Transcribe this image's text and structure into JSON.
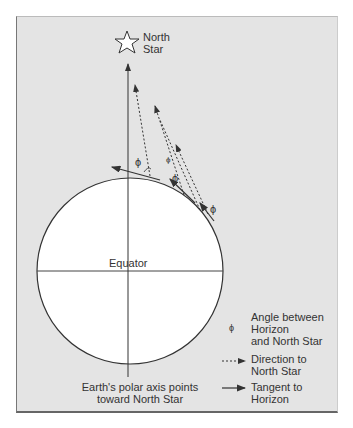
{
  "star_label": "North\nStar",
  "star_label_l1": "North",
  "star_label_l2": "Star",
  "equator_label": "Equator",
  "axis_caption_l1": "Earth's polar axis points",
  "axis_caption_l2": "toward North Star",
  "angle_symbol": "ϕ",
  "legend": {
    "items": [
      {
        "symbol": "ϕ",
        "label_l1": "Angle between",
        "label_l2": "Horizon",
        "label_l3": "and North Star"
      },
      {
        "symbol": "dashed-arrow",
        "label_l1": "Direction to",
        "label_l2": "North Star"
      },
      {
        "symbol": "solid-arrow",
        "label_l1": "Tangent to",
        "label_l2": "Horizon"
      }
    ]
  },
  "colors": {
    "background": "#e4e4e4",
    "earth": "#ffffff",
    "line": "#333333"
  }
}
